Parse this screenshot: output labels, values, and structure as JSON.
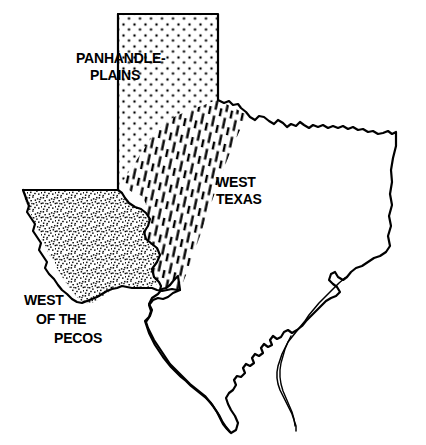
{
  "map": {
    "title": "Texas Regions Map",
    "subject": "Texas",
    "background_color": "#ffffff",
    "outline_color": "#000000",
    "outline_width": 2.2,
    "regions": [
      {
        "id": "panhandle-plains",
        "label_lines": [
          "PANHANDLE-",
          "PLAINS"
        ],
        "pattern": "dots",
        "pattern_description": "stippled dot fill",
        "pattern_color": "#000000",
        "label_x": 76,
        "label_y": 63,
        "label_anchor": "start",
        "label_line_height": 17
      },
      {
        "id": "west-texas",
        "label_lines": [
          "WEST",
          "TEXAS"
        ],
        "pattern": "hatch",
        "pattern_description": "diagonal dashed hatch lines",
        "pattern_color": "#000000",
        "label_x": 216,
        "label_y": 187,
        "label_anchor": "start",
        "label_line_height": 17
      },
      {
        "id": "west-of-the-pecos",
        "label_lines": [
          "WEST",
          "OF THE",
          "PECOS"
        ],
        "pattern": "speckle",
        "pattern_description": "dense fine speckle / noise fill",
        "pattern_color": "#000000",
        "label_x": 24,
        "label_y": 305,
        "label_anchor": "start",
        "label_line_height": 19,
        "label_indents": [
          0,
          12,
          30
        ]
      }
    ],
    "legend_present": false,
    "border_features": [
      "red-river-wavy-northern-border",
      "eastern-sabine-border",
      "gulf-coast-with-barrier-islands",
      "rio-grande-southern-border",
      "panhandle-rectangular-north"
    ]
  }
}
